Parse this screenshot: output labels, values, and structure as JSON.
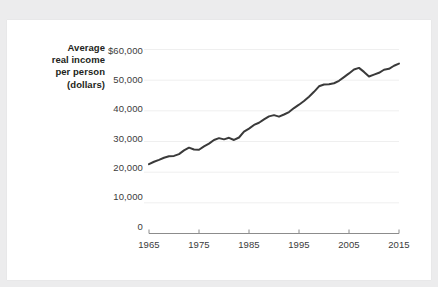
{
  "figure": {
    "axis_title_lines": [
      "Average",
      "real income",
      "per person",
      "(dollars)"
    ],
    "axis_title": "Average real income per person (dollars)",
    "line_color": "#3a3a3a",
    "grid_color": "#efefef",
    "axis_color": "#8c8c8c",
    "card_color": "#ffffff",
    "page_color": "#ececed"
  },
  "chart_data": {
    "type": "line",
    "title": "",
    "xlabel": "",
    "ylabel": "Average real income per person (dollars)",
    "xlim": [
      1965,
      2015
    ],
    "ylim": [
      0,
      60000
    ],
    "grid": true,
    "legend": "none",
    "yticks": [
      0,
      10000,
      20000,
      30000,
      40000,
      50000,
      60000
    ],
    "ytick_labels": [
      "0",
      "10,000",
      "20,000",
      "30,000",
      "40,000",
      "50,000",
      "$60,000"
    ],
    "xticks": [
      1965,
      1975,
      1985,
      1995,
      2005,
      2015
    ],
    "xtick_labels": [
      "1965",
      "1975",
      "1985",
      "1995",
      "2005",
      "2015"
    ],
    "series": [
      {
        "name": "Average real income per person (dollars)",
        "x": [
          1965,
          1966,
          1967,
          1968,
          1969,
          1970,
          1971,
          1972,
          1973,
          1974,
          1975,
          1976,
          1977,
          1978,
          1979,
          1980,
          1981,
          1982,
          1983,
          1984,
          1985,
          1986,
          1987,
          1988,
          1989,
          1990,
          1991,
          1992,
          1993,
          1994,
          1995,
          1996,
          1997,
          1998,
          1999,
          2000,
          2001,
          2002,
          2003,
          2004,
          2005,
          2006,
          2007,
          2008,
          2009,
          2010,
          2011,
          2012,
          2013,
          2014,
          2015
        ],
        "values": [
          22600,
          23400,
          24000,
          24700,
          25200,
          25300,
          25900,
          27100,
          28000,
          27400,
          27300,
          28400,
          29300,
          30500,
          31100,
          30700,
          31200,
          30500,
          31300,
          33200,
          34200,
          35400,
          36100,
          37200,
          38200,
          38600,
          38100,
          38800,
          39600,
          40900,
          42000,
          43200,
          44600,
          46200,
          48000,
          48600,
          48700,
          49000,
          49800,
          51000,
          52200,
          53500,
          54000,
          52700,
          51200,
          51800,
          52400,
          53400,
          53700,
          54700,
          55400
        ]
      }
    ]
  }
}
